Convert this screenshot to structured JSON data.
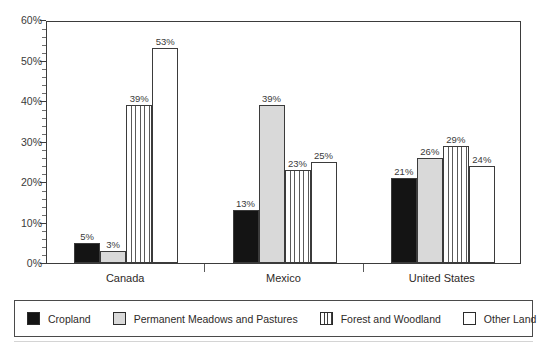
{
  "chart_data": {
    "type": "bar",
    "title": "",
    "xlabel": "",
    "ylabel": "",
    "ylim": [
      0,
      60
    ],
    "yunit": "%",
    "ytick_step": 10,
    "yminor_step": 2,
    "grid": false,
    "legend_position": "bottom",
    "categories": [
      "Canada",
      "Mexico",
      "United States"
    ],
    "ytick_labels": [
      "0%",
      "10%",
      "20%",
      "30%",
      "40%",
      "50%",
      "60%"
    ],
    "series": [
      {
        "name": "Cropland",
        "fill": "black",
        "color": "#141414",
        "values": [
          5,
          13,
          21
        ],
        "labels": [
          "5%",
          "13%",
          "21%"
        ]
      },
      {
        "name": "Permanent Meadows and Pastures",
        "fill": "light-gray",
        "color": "#d9d9d9",
        "values": [
          3,
          39,
          26
        ],
        "labels": [
          "3%",
          "39%",
          "26%"
        ]
      },
      {
        "name": "Forest and Woodland",
        "fill": "vertical-stripes",
        "color": "#5a5a5a",
        "values": [
          39,
          23,
          29
        ],
        "labels": [
          "39%",
          "23%",
          "29%"
        ]
      },
      {
        "name": "Other Land",
        "fill": "white",
        "color": "#ffffff",
        "values": [
          53,
          25,
          24
        ],
        "labels": [
          "53%",
          "25%",
          "24%"
        ]
      }
    ]
  }
}
